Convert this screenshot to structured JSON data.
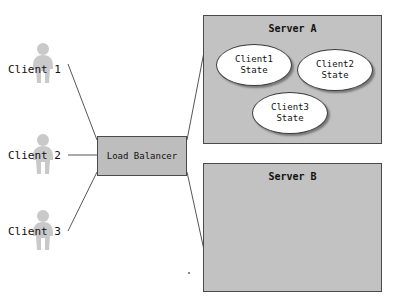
{
  "diagram": {
    "colors": {
      "server_fill": "#c2c2c2",
      "load_balancer_fill": "#bdbdbd",
      "ellipse_fill": "#ffffff",
      "stroke": "#4a4a4a",
      "figure_fill": "#c9c9c9",
      "text": "#111111",
      "background": "#ffffff"
    },
    "clients": [
      {
        "id": "client-1",
        "label": "Client 1",
        "icon": "person-icon"
      },
      {
        "id": "client-2",
        "label": "Client 2",
        "icon": "person-icon"
      },
      {
        "id": "client-3",
        "label": "Client 3",
        "icon": "person-icon"
      }
    ],
    "load_balancer": {
      "label": "Load Balancer"
    },
    "servers": [
      {
        "id": "server-a",
        "title": "Server A",
        "states": [
          {
            "id": "client1-state",
            "line1": "Client1",
            "line2": "State"
          },
          {
            "id": "client2-state",
            "line1": "Client2",
            "line2": "State"
          },
          {
            "id": "client3-state",
            "line1": "Client3",
            "line2": "State"
          }
        ]
      },
      {
        "id": "server-b",
        "title": "Server B",
        "states": []
      }
    ],
    "connections": [
      {
        "from": "client-1",
        "to": "load-balancer"
      },
      {
        "from": "client-2",
        "to": "load-balancer"
      },
      {
        "from": "client-3",
        "to": "load-balancer"
      },
      {
        "from": "load-balancer",
        "to": "server-a"
      },
      {
        "from": "load-balancer",
        "to": "server-b"
      }
    ]
  }
}
